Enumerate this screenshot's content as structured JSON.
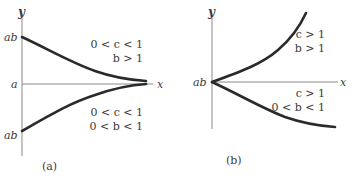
{
  "figure": {
    "panels": [
      {
        "id": "a",
        "caption": "(a)",
        "y_axis_label": "y",
        "x_axis_label": "x",
        "tick_labels": {
          "upper": "ab",
          "asymptote": "a",
          "lower": "ab"
        },
        "upper_curve": {
          "condition_1": "0 < c < 1",
          "condition_2": "b > 1",
          "behavior": "decreasing toward asymptote y = a"
        },
        "lower_curve": {
          "condition_1": "0 < c < 1",
          "condition_2": "0 < b < 1",
          "behavior": "increasing toward asymptote y = a"
        }
      },
      {
        "id": "b",
        "caption": "(b)",
        "y_axis_label": "y",
        "x_axis_label": "x",
        "tick_labels": {
          "origin": "ab"
        },
        "upper_curve": {
          "condition_1": "c > 1",
          "condition_2": "b > 1",
          "behavior": "increasing, concave up"
        },
        "lower_curve": {
          "condition_1": "c > 1",
          "condition_2": "0 < b < 1",
          "behavior": "decreasing, leveling off"
        }
      }
    ]
  },
  "colors": {
    "curve": "#2a2a2a",
    "axis": "#8a8a8a",
    "text": "#3a3a3a",
    "background": "#ffffff"
  }
}
